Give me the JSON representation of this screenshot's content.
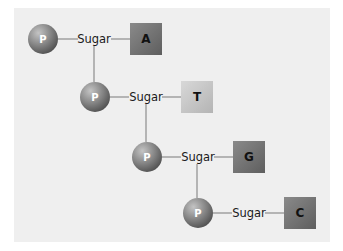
{
  "diagram": {
    "type": "nucleotide-chain",
    "phosphate_label": "P",
    "sugar_label": "Sugar",
    "colors": {
      "background": "#efefef",
      "phosphate": "#8a8a8a",
      "line": "#8c8c8c",
      "base_A": "#7a7a7a",
      "base_T": "#c8c8c8",
      "base_G": "#6e6e6e",
      "base_C": "#737373"
    },
    "nucleotides": [
      {
        "phosphate": "P",
        "sugar": "Sugar",
        "base": "A"
      },
      {
        "phosphate": "P",
        "sugar": "Sugar",
        "base": "T"
      },
      {
        "phosphate": "P",
        "sugar": "Sugar",
        "base": "G"
      },
      {
        "phosphate": "P",
        "sugar": "Sugar",
        "base": "C"
      }
    ]
  }
}
